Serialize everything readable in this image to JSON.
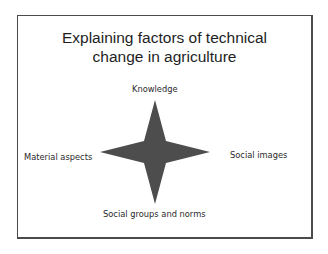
{
  "slide": {
    "title_line1": "Explaining factors of technical",
    "title_line2": "change in agriculture"
  },
  "diagram": {
    "shape": "four-point-star-icon",
    "shape_color": "#4d4d4d",
    "labels": {
      "top": "Knowledge",
      "left": "Material aspects",
      "right": "Social images",
      "bottom": "Social groups and norms"
    }
  }
}
